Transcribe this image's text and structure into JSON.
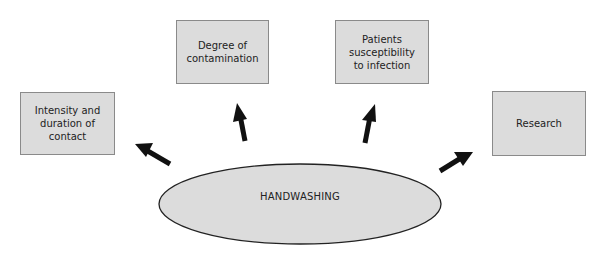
{
  "diagram": {
    "center": {
      "label": "HANDWASHING"
    },
    "boxes": [
      {
        "id": "intensity",
        "label": "Intensity and\nduration of\ncontact"
      },
      {
        "id": "degree",
        "label": "Degree of\ncontamination"
      },
      {
        "id": "patients",
        "label": "Patients\nsusceptibility\nto infection"
      },
      {
        "id": "research",
        "label": "Research"
      }
    ],
    "colors": {
      "box_fill": "#dcdcdc",
      "box_border": "#8a8a8a",
      "ellipse_fill": "#dcdcdc",
      "ellipse_stroke": "#222222",
      "arrow": "#111111"
    }
  }
}
